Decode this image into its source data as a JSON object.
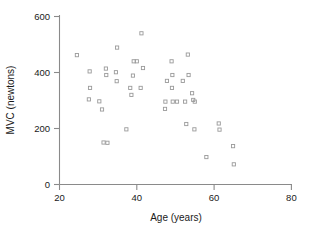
{
  "chart_data": {
    "type": "scatter",
    "title": "",
    "xlabel": "Age (years)",
    "ylabel": "MVC (newtons)",
    "xlim": [
      20,
      80
    ],
    "ylim": [
      0,
      600
    ],
    "xticks": [
      20,
      40,
      60,
      80
    ],
    "yticks": [
      0,
      200,
      400,
      600
    ],
    "xtick_labels": [
      "20",
      "40",
      "60",
      "80"
    ],
    "ytick_labels": [
      "0",
      "200",
      "400",
      "600"
    ],
    "grid": false,
    "legend": null,
    "marker": "open-square",
    "marker_color": "#9a9a9a",
    "n_points": 53,
    "points": [
      {
        "x": 24.5,
        "y": 462
      },
      {
        "x": 27.8,
        "y": 404
      },
      {
        "x": 27.9,
        "y": 345
      },
      {
        "x": 27.6,
        "y": 304
      },
      {
        "x": 30.3,
        "y": 297
      },
      {
        "x": 31.0,
        "y": 268
      },
      {
        "x": 31.4,
        "y": 150
      },
      {
        "x": 32.4,
        "y": 149
      },
      {
        "x": 32.0,
        "y": 414
      },
      {
        "x": 32.1,
        "y": 391
      },
      {
        "x": 34.6,
        "y": 401
      },
      {
        "x": 34.9,
        "y": 489
      },
      {
        "x": 34.8,
        "y": 369
      },
      {
        "x": 37.3,
        "y": 197
      },
      {
        "x": 38.3,
        "y": 345
      },
      {
        "x": 38.6,
        "y": 320
      },
      {
        "x": 39.0,
        "y": 389
      },
      {
        "x": 39.2,
        "y": 440
      },
      {
        "x": 40.0,
        "y": 440
      },
      {
        "x": 41.2,
        "y": 540
      },
      {
        "x": 41.0,
        "y": 345
      },
      {
        "x": 41.6,
        "y": 416
      },
      {
        "x": 47.4,
        "y": 296
      },
      {
        "x": 47.3,
        "y": 270
      },
      {
        "x": 47.8,
        "y": 370
      },
      {
        "x": 49.0,
        "y": 440
      },
      {
        "x": 49.2,
        "y": 391
      },
      {
        "x": 49.3,
        "y": 296
      },
      {
        "x": 49.1,
        "y": 345
      },
      {
        "x": 50.4,
        "y": 296
      },
      {
        "x": 51.9,
        "y": 370
      },
      {
        "x": 52.5,
        "y": 296
      },
      {
        "x": 52.8,
        "y": 216
      },
      {
        "x": 53.2,
        "y": 464
      },
      {
        "x": 53.4,
        "y": 391
      },
      {
        "x": 54.3,
        "y": 326
      },
      {
        "x": 54.6,
        "y": 302
      },
      {
        "x": 54.9,
        "y": 197
      },
      {
        "x": 55.0,
        "y": 296
      },
      {
        "x": 58.0,
        "y": 98
      },
      {
        "x": 61.2,
        "y": 218
      },
      {
        "x": 61.4,
        "y": 196
      },
      {
        "x": 64.9,
        "y": 137
      },
      {
        "x": 65.1,
        "y": 72
      }
    ]
  },
  "axes": {
    "x_title": "Age (years)",
    "y_title": "MVC (newtons)"
  }
}
